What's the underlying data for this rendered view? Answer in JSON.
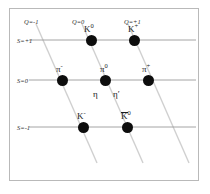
{
  "figure": {
    "width": 210,
    "height": 194,
    "background_color": "#ffffff",
    "frame_color": "#b9b9b9",
    "dot_color": "#0d0d0d",
    "strangeness_line_color": "#9a9a9a",
    "charge_line_color": "#d0d0d0"
  },
  "axes": {
    "strangeness_labels": [
      {
        "text": "S=+1",
        "value": 1,
        "x": 17,
        "y": 38
      },
      {
        "text": "S=0",
        "value": 0,
        "x": 17,
        "y": 78
      },
      {
        "text": "S=-1",
        "value": -1,
        "x": 17,
        "y": 125
      }
    ],
    "charge_labels": [
      {
        "text": "Q=-1",
        "value": -1,
        "x": 24,
        "y": 19
      },
      {
        "text": "Q=0",
        "value": 0,
        "x": 72,
        "y": 19
      },
      {
        "text": "Q=+1",
        "value": 1,
        "x": 124,
        "y": 19
      }
    ]
  },
  "strangeness_lines": [
    {
      "name": "S=+1",
      "x1": 29,
      "y1": 40,
      "x2": 196,
      "y2": 40
    },
    {
      "name": "S=0",
      "x1": 29,
      "y1": 80,
      "x2": 196,
      "y2": 80
    },
    {
      "name": "S=-1",
      "x1": 29,
      "y1": 127,
      "x2": 196,
      "y2": 127
    }
  ],
  "charge_lines": [
    {
      "name": "Q=-1",
      "x1": 36,
      "y1": 24,
      "x2": 97,
      "y2": 163
    },
    {
      "name": "Q=0",
      "x1": 82,
      "y1": 24,
      "x2": 143,
      "y2": 163
    },
    {
      "name": "Q=+1",
      "x1": 128,
      "y1": 24,
      "x2": 189,
      "y2": 163
    }
  ],
  "particles": [
    {
      "id": "k-zero-top",
      "symbol": "K",
      "superscript": "0",
      "overline": false,
      "x": 91,
      "y": 40,
      "strangeness": 1,
      "charge": 0,
      "label_x": 84,
      "label_y": 25
    },
    {
      "id": "k-plus",
      "symbol": "K",
      "superscript": "+",
      "overline": false,
      "x": 134,
      "y": 40,
      "strangeness": 1,
      "charge": 1,
      "label_x": 128,
      "label_y": 25
    },
    {
      "id": "pi-minus",
      "symbol": "π",
      "superscript": "-",
      "overline": false,
      "x": 62,
      "y": 80,
      "strangeness": 0,
      "charge": -1,
      "label_x": 56,
      "label_y": 65
    },
    {
      "id": "pi-zero",
      "symbol": "π",
      "superscript": "0",
      "overline": false,
      "x": 105,
      "y": 80,
      "strangeness": 0,
      "charge": 0,
      "label_x": 100,
      "label_y": 65
    },
    {
      "id": "pi-plus",
      "symbol": "π",
      "superscript": "+",
      "overline": false,
      "x": 148,
      "y": 80,
      "strangeness": 0,
      "charge": 1,
      "label_x": 142,
      "label_y": 65
    },
    {
      "id": "k-minus",
      "symbol": "K",
      "superscript": "-",
      "overline": false,
      "x": 83,
      "y": 127,
      "strangeness": -1,
      "charge": -1,
      "label_x": 77,
      "label_y": 112
    },
    {
      "id": "k-zero-bar",
      "symbol": "K",
      "superscript": "0",
      "overline": true,
      "x": 127,
      "y": 127,
      "strangeness": -1,
      "charge": 0,
      "label_x": 121,
      "label_y": 112
    }
  ],
  "center_extra_labels": [
    {
      "id": "eta",
      "symbol": "η",
      "superscript": "",
      "x": 93,
      "y": 90
    },
    {
      "id": "eta-prime",
      "symbol": "η",
      "superscript": "′",
      "x": 113,
      "y": 90
    }
  ],
  "chart_data": {
    "type": "scatter",
    "xlabel": "Q (electric charge)",
    "ylabel": "S (strangeness)",
    "grid": true,
    "legend": "none",
    "xlim": [
      -1,
      1
    ],
    "ylim": [
      -1,
      1
    ],
    "xticks": [
      -1,
      0,
      1
    ],
    "xticklabels": [
      "Q=-1",
      "Q=0",
      "Q=+1"
    ],
    "yticks": [
      -1,
      0,
      1
    ],
    "yticklabels": [
      "S=-1",
      "S=0",
      "S=+1"
    ],
    "points": [
      {
        "label": "K0",
        "x": 0,
        "y": 1
      },
      {
        "label": "K+",
        "x": 1,
        "y": 1
      },
      {
        "label": "pi-",
        "x": -1,
        "y": 0
      },
      {
        "label": "pi0",
        "x": 0,
        "y": 0
      },
      {
        "label": "eta",
        "x": 0,
        "y": 0
      },
      {
        "label": "eta'",
        "x": 0,
        "y": 0
      },
      {
        "label": "pi+",
        "x": 1,
        "y": 0
      },
      {
        "label": "K-",
        "x": -1,
        "y": -1
      },
      {
        "label": "K0bar",
        "x": 0,
        "y": -1
      }
    ]
  }
}
